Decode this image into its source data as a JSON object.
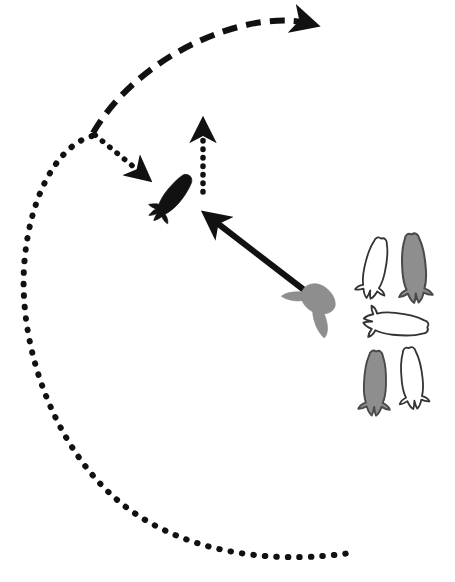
{
  "figure": {
    "width": 455,
    "height": 582,
    "background_color": "#ffffff",
    "stroke_color": "#111111",
    "fill_gray": "#999999",
    "fill_dark": "#111111"
  },
  "paths": {
    "dashed_arc": {
      "name": "dashed-arc-trajectory",
      "style": "dashed",
      "description": "Large dashed arc sweeping from lower-left up over the top and ending with a solid arrowhead pointing right",
      "d": "M 93 133 C 120 86, 175 44, 238 27 C 268 19, 294 19, 312 24",
      "stroke_width": 6,
      "dash_pattern": "15 9",
      "arrowhead": {
        "x": 318,
        "y": 25,
        "angle_deg": 8,
        "size": 13
      }
    },
    "dotted_big_arc": {
      "name": "dotted-sweep-arc",
      "style": "dotted",
      "description": "Large dotted arc starting at the dashed-arc terminus, curving down the left side and sweeping right along the bottom",
      "d": "M 92 136 C 56 146, 28 200, 24 268 C 19 355, 60 460, 130 510 C 200 560, 290 562, 350 553",
      "stroke_width": 6,
      "dash_pattern": "0.5 11"
    },
    "dotted_short_arrow": {
      "name": "dotted-attack-vector",
      "style": "dotted",
      "description": "Short dotted line from the arc origin down-right to a solid arrowhead aimed at the dark fish",
      "d": "M 95 135 L 146 177",
      "stroke_width": 5.5,
      "dash_pattern": "0.5 9",
      "arrowhead": {
        "x": 153,
        "y": 183,
        "angle_deg": 40,
        "size": 11
      }
    },
    "dotted_vertical_arrow": {
      "name": "dotted-vertical-arrow",
      "style": "dotted",
      "description": "Vertical dotted arrow pointing upward with a solid triangular head",
      "d": "M 203 192 L 203 124",
      "stroke_width": 5.5,
      "dash_pattern": "0.5 8",
      "arrowhead": {
        "x": 203,
        "y": 113,
        "angle_deg": -90,
        "size": 11
      }
    },
    "solid_arrow": {
      "name": "solid-approach-arrow",
      "style": "solid",
      "description": "Thick solid arrow from the gray fish up-left toward the dark fish",
      "d": "M 308 293 L 208 216",
      "stroke_width": 6,
      "arrowhead": {
        "x": 198,
        "y": 208,
        "angle_deg": -142,
        "size": 14
      }
    }
  },
  "animals": {
    "dark_fish": {
      "name": "dark-fish-prey",
      "label": "dark fish",
      "fill": "#111111",
      "cx": 172,
      "cy": 198,
      "rotation_deg": 38,
      "scale": 1.0
    },
    "gray_fish": {
      "name": "gray-fish-predator",
      "label": "gray fish",
      "fill": "#8e8e8e",
      "cx": 317,
      "cy": 299,
      "rotation_deg": 115,
      "scale": 1.15
    }
  },
  "legend_group": {
    "name": "fish-shoal-group",
    "description": "Cluster of five fish silhouettes at the right side: three white outlines and two gray filled",
    "items": [
      {
        "name": "shoal-fish-1",
        "fill": "#ffffff",
        "stroke": "#333333",
        "cx": 375,
        "cy": 268,
        "rotation_deg": 12,
        "scale": 1.0,
        "shade": "white"
      },
      {
        "name": "shoal-fish-2",
        "fill": "#8e8e8e",
        "stroke": "#4a4a4a",
        "cx": 414,
        "cy": 268,
        "rotation_deg": -4,
        "scale": 1.12,
        "shade": "gray"
      },
      {
        "name": "shoal-fish-3",
        "fill": "#ffffff",
        "stroke": "#333333",
        "cx": 396,
        "cy": 324,
        "rotation_deg": 96,
        "scale": 1.05,
        "shade": "white"
      },
      {
        "name": "shoal-fish-4",
        "fill": "#8e8e8e",
        "stroke": "#4a4a4a",
        "cx": 375,
        "cy": 383,
        "rotation_deg": 2,
        "scale": 1.05,
        "shade": "gray"
      },
      {
        "name": "shoal-fish-5",
        "fill": "#ffffff",
        "stroke": "#333333",
        "cx": 412,
        "cy": 378,
        "rotation_deg": -6,
        "scale": 1.0,
        "shade": "white"
      }
    ]
  }
}
